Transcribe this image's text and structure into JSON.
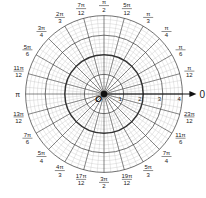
{
  "diagram": {
    "type": "polar-grid",
    "center": {
      "x": 104,
      "y": 94
    },
    "unit_px": 19.6,
    "max_radius_units": 4,
    "bold_ring_units": 2,
    "radial_labels": [
      "1",
      "2",
      "3",
      "4"
    ],
    "origin_label": "O",
    "axis_label": "0",
    "colors": {
      "grid_major": "#333333",
      "grid_minor": "#bdbdbd",
      "text": "#1a1a1a",
      "background": "#ffffff"
    },
    "angle_labels": [
      {
        "deg": 15,
        "num": "π",
        "den": "12"
      },
      {
        "deg": 30,
        "num": "π",
        "den": "6"
      },
      {
        "deg": 45,
        "num": "π",
        "den": "4"
      },
      {
        "deg": 60,
        "num": "π",
        "den": "3"
      },
      {
        "deg": 75,
        "num": "5π",
        "den": "12"
      },
      {
        "deg": 90,
        "num": "π",
        "den": "2"
      },
      {
        "deg": 105,
        "num": "7π",
        "den": "12"
      },
      {
        "deg": 120,
        "num": "2π",
        "den": "3"
      },
      {
        "deg": 135,
        "num": "3π",
        "den": "4"
      },
      {
        "deg": 150,
        "num": "5π",
        "den": "6"
      },
      {
        "deg": 165,
        "num": "11π",
        "den": "12"
      },
      {
        "deg": 180,
        "num": "π",
        "den": ""
      },
      {
        "deg": 195,
        "num": "13π",
        "den": "12"
      },
      {
        "deg": 210,
        "num": "7π",
        "den": "6"
      },
      {
        "deg": 225,
        "num": "5π",
        "den": "4"
      },
      {
        "deg": 240,
        "num": "4π",
        "den": "3"
      },
      {
        "deg": 255,
        "num": "17π",
        "den": "12"
      },
      {
        "deg": 270,
        "num": "3π",
        "den": "2"
      },
      {
        "deg": 285,
        "num": "19π",
        "den": "12"
      },
      {
        "deg": 300,
        "num": "5π",
        "den": "3"
      },
      {
        "deg": 315,
        "num": "7π",
        "den": "4"
      },
      {
        "deg": 330,
        "num": "11π",
        "den": "6"
      },
      {
        "deg": 345,
        "num": "23π",
        "den": "12"
      }
    ]
  }
}
